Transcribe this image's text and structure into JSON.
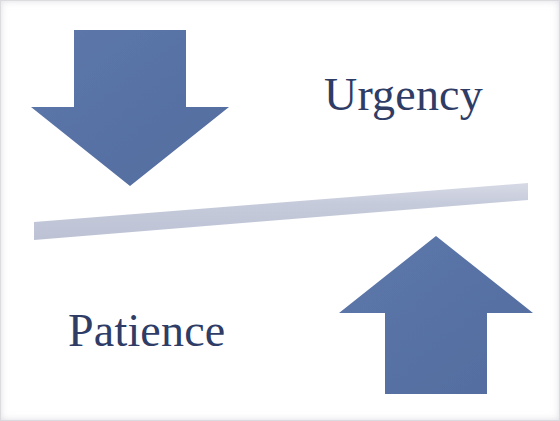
{
  "image": {
    "title": "Urgency versus Patience seesaw diagram",
    "width": 560,
    "height": 421,
    "background_color": "#ffffff"
  },
  "palette": {
    "arrow_blue": "#5a74a8",
    "arrow_blue_dark": "#4d669a",
    "beam_gray_blue": "#c2c7d8",
    "beam_gray_blue_light": "#d2d6e2",
    "text_navy": "#2e3c66",
    "scan_edge": "#d7d7de"
  },
  "labels": {
    "urgency": {
      "text": "Urgency",
      "color": "#2e3c66",
      "font_size_px": 46,
      "x": 324,
      "y": 72
    },
    "patience": {
      "text": "Patience",
      "color": "#2e3c66",
      "font_size_px": 46,
      "x": 68,
      "y": 308
    }
  },
  "shapes": {
    "down_arrow": {
      "name": "down-arrow",
      "meaning": "Urgency pressing down",
      "color": "#5a74a8",
      "points": "74,30 186,30 186,107 229,107 130,186 31,107 74,107",
      "tip": {
        "x": 130,
        "y": 186
      },
      "shaft": {
        "left": 74,
        "right": 186,
        "top": 30,
        "bottom": 107
      }
    },
    "up_arrow": {
      "name": "up-arrow",
      "meaning": "Patience lifting up",
      "color": "#5a74a8",
      "points": "436,236 533,313 487,313 487,394 385,394 385,313 339,313",
      "tip": {
        "x": 436,
        "y": 236
      },
      "shaft": {
        "left": 385,
        "right": 487,
        "top": 313,
        "bottom": 394
      }
    },
    "beam": {
      "name": "tilted-beam",
      "meaning": "seesaw plank tilted up toward the right",
      "color": "#c2c7d8",
      "points": "34,222 528,183 528,200 34,240",
      "left_end": {
        "x": 34,
        "y": 231
      },
      "right_end": {
        "x": 528,
        "y": 191
      },
      "thickness_px": 17,
      "tilt_degrees": -4.5
    }
  },
  "chart_data": {
    "type": "diagram",
    "elements": [
      {
        "label": "Urgency",
        "direction": "down",
        "side": "left",
        "arrow": "down-arrow"
      },
      {
        "label": "Patience",
        "direction": "up",
        "side": "right",
        "arrow": "up-arrow"
      }
    ],
    "annotations": [
      "Urgency",
      "Patience"
    ]
  }
}
